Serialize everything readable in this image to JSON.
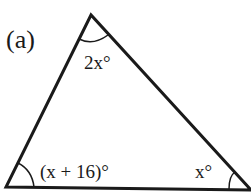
{
  "figure": {
    "label": "(a)",
    "shape": "triangle",
    "angles": {
      "top": "2x°",
      "bottom_left": "(x + 16)°",
      "bottom_right": "x°"
    },
    "colors": {
      "stroke": "#1a1a1a",
      "background": "#ffffff"
    }
  }
}
